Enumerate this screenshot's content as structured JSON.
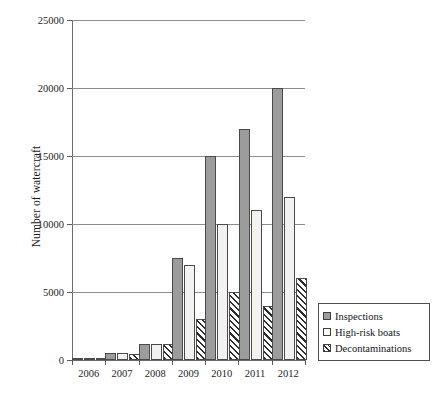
{
  "chart_data": {
    "type": "bar",
    "title": "",
    "xlabel": "",
    "ylabel": "Number of watercraft",
    "categories": [
      "2006",
      "2007",
      "2008",
      "2009",
      "2010",
      "2011",
      "2012"
    ],
    "series": [
      {
        "name": "Inspections",
        "values": [
          100,
          500,
          1200,
          7500,
          15000,
          17000,
          20000
        ]
      },
      {
        "name": "High-risk boats",
        "values": [
          100,
          500,
          1200,
          7000,
          10000,
          11000,
          12000
        ]
      },
      {
        "name": "Decontaminations",
        "values": [
          80,
          450,
          1200,
          3000,
          5000,
          4000,
          6000
        ]
      }
    ],
    "ylim": [
      0,
      25000
    ],
    "yticks": [
      0,
      5000,
      10000,
      15000,
      20000,
      25000
    ],
    "ytick_labels": [
      "0",
      "5000",
      "10000",
      "15000",
      "20000",
      "25000"
    ],
    "grid": "horizontal",
    "legend_position": "bottom-right-outside",
    "series_styles": [
      "solid-gray",
      "solid-white",
      "diagonal-hatch"
    ],
    "colors": {
      "series_0_fill": "#9c9c9c",
      "series_1_fill": "#f4f2ef",
      "series_2_fill": "#ffffff",
      "series_2_hatch": "#2b2b2b",
      "bar_outline": "#4a4a4a",
      "axis": "#6b6b6b",
      "gridline": "#8d8d8d",
      "text": "#1a1a1a",
      "background": "#ffffff"
    }
  },
  "axis": {
    "ylabel": "Number of watercraft"
  },
  "legend": {
    "entries": [
      {
        "label": "Inspections"
      },
      {
        "label": "High-risk boats"
      },
      {
        "label": "Decontaminations"
      }
    ]
  }
}
